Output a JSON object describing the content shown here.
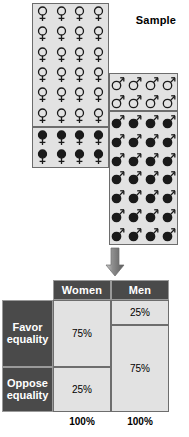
{
  "figure": {
    "sample_label": "Sample"
  },
  "sample_panels": [
    {
      "id": "women-open",
      "symbol": "female-symbol",
      "style": "open",
      "rows": 6,
      "cols": 4,
      "count": 24
    },
    {
      "id": "women-solid",
      "symbol": "female-symbol",
      "style": "solid",
      "rows": 2,
      "cols": 4,
      "count": 8
    },
    {
      "id": "men-open",
      "symbol": "male-symbol",
      "style": "open",
      "rows": 2,
      "cols": 4,
      "count": 8
    },
    {
      "id": "men-solid",
      "symbol": "male-symbol",
      "style": "solid",
      "rows": 7,
      "cols": 4,
      "count": 28
    }
  ],
  "arrow": {
    "icon": "down-arrow-icon",
    "direction": "down"
  },
  "table": {
    "column_headers": [
      "Women",
      "Men"
    ],
    "row_labels": [
      {
        "line1": "Favor",
        "line2": "equality"
      },
      {
        "line1": "Oppose",
        "line2": "equality"
      }
    ],
    "cells": {
      "women_favor": "75%",
      "women_oppose": "25%",
      "men_favor": "25%",
      "men_oppose": "75%"
    },
    "totals": [
      "100%",
      "100%"
    ]
  },
  "chart_data": {
    "type": "bar",
    "title": "Sample",
    "categories": [
      "Women",
      "Men"
    ],
    "series": [
      {
        "name": "Favor equality",
        "values": [
          75,
          25
        ]
      },
      {
        "name": "Oppose equality",
        "values": [
          25,
          75
        ]
      }
    ],
    "xlabel": "",
    "ylabel": "",
    "ylim": [
      0,
      100
    ],
    "totals": [
      100,
      100
    ],
    "grid": false,
    "legend": "none",
    "annotations": [
      "100%",
      "100%"
    ]
  }
}
